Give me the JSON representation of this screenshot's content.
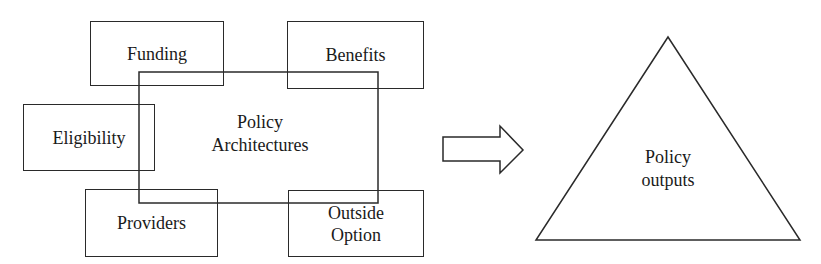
{
  "diagram": {
    "center": {
      "label": "Policy\nArchitectures"
    },
    "components": [
      {
        "id": "funding",
        "label": "Funding"
      },
      {
        "id": "benefits",
        "label": "Benefits"
      },
      {
        "id": "eligibility",
        "label": "Eligibility"
      },
      {
        "id": "providers",
        "label": "Providers"
      },
      {
        "id": "outside-option",
        "label": "Outside\nOption"
      }
    ],
    "arrow": {
      "direction": "right",
      "style": "block-outline"
    },
    "output": {
      "shape": "triangle",
      "label": "Policy\noutputs"
    },
    "colors": {
      "stroke": "#2a2a2a",
      "text": "#1a1a1a",
      "background": "#ffffff"
    }
  }
}
